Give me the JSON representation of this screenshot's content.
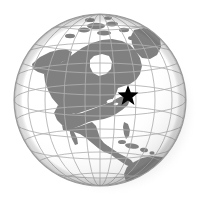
{
  "figure": {
    "name": "globe-illustration",
    "type": "orthographic-globe"
  },
  "canvas": {
    "width": 208,
    "height": 210,
    "background": "#ffffff"
  },
  "globe": {
    "center_x": 100,
    "center_y": 100,
    "radius": 86,
    "ocean_color": "#ffffff",
    "land_color": "#808080",
    "outline_color": "#9a9a9a",
    "graticule_color": "#b0b0b0",
    "shadow_color": "#c8c8c8",
    "terminator_color": "#d8d8d8"
  },
  "graticule": {
    "latitude_step_degrees": 20,
    "longitude_step_degrees": 20,
    "latitudes": [
      -60,
      -40,
      -20,
      0,
      20,
      40,
      60,
      80
    ],
    "longitudes": [
      -160,
      -140,
      -120,
      -100,
      -80,
      -60,
      -40,
      -20
    ],
    "visible": true
  },
  "marker": {
    "name": "star-marker",
    "shape": "star",
    "points": 5,
    "color": "#000000",
    "x": 128,
    "y": 96,
    "size": 11,
    "label": ""
  },
  "landmasses": [
    {
      "name": "greenland"
    },
    {
      "name": "canada"
    },
    {
      "name": "alaska"
    },
    {
      "name": "united-states"
    },
    {
      "name": "mexico"
    },
    {
      "name": "central-america"
    },
    {
      "name": "caribbean-islands"
    },
    {
      "name": "south-america"
    },
    {
      "name": "arctic-islands"
    }
  ],
  "water_bodies": [
    {
      "name": "hudson-bay"
    },
    {
      "name": "great-lakes"
    },
    {
      "name": "gulf-of-mexico"
    },
    {
      "name": "pacific-ocean"
    },
    {
      "name": "atlantic-ocean"
    }
  ]
}
